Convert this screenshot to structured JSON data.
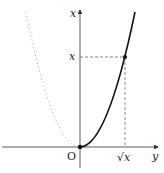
{
  "diagram": {
    "labels": {
      "vertical_axis": "x",
      "horizontal_axis": "y",
      "origin": "O",
      "point_height": "x",
      "point_base": "√x"
    },
    "colors": {
      "axis": "#333333",
      "curve_solid": "#111111",
      "curve_dotted": "#999999",
      "dashed": "#555555"
    }
  }
}
